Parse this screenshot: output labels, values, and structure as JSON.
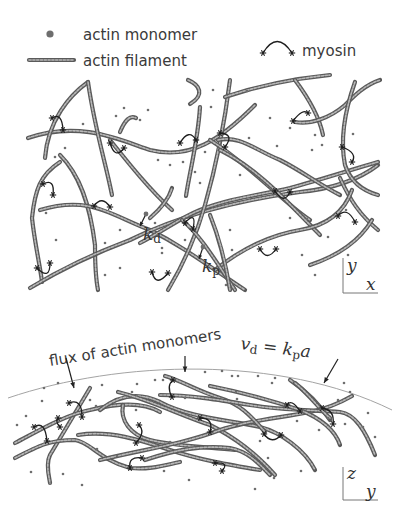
{
  "legend": {
    "monomer_label": "actin monomer",
    "filament_label": "actin filament",
    "myosin_label": "myosin"
  },
  "top_panel": {
    "rates": {
      "kd_main": "k",
      "kd_sub": "d",
      "kp_main": "k",
      "kp_sub": "p"
    },
    "axes": {
      "vertical": "y",
      "horizontal": "x"
    },
    "filaments": [
      "M28,138 C80,120 120,140 150,150 C190,160 220,140 255,105",
      "M45,158 C48,120 70,95 88,82",
      "M88,82 C95,130 105,160 112,195",
      "M188,80 C200,85 205,95 190,104",
      "M120,132 C125,120 130,115 136,118",
      "M200,107 C198,140 190,170 186,196",
      "M110,140 C130,165 150,190 172,210",
      "M60,155 C80,175 90,205 95,245 C95,270 97,285 98,290",
      "M60,162 C40,175 35,190 32,218 C35,245 40,265 42,282",
      "M40,210 C90,195 110,215 150,230 C180,245 200,260 245,290",
      "M30,288 C60,270 90,255 130,240 C180,215 240,200 300,192 C340,188 365,175 378,165",
      "M150,218 C165,205 170,195 172,188",
      "M140,243 C165,230 180,218 200,210 C230,198 260,195 290,188 C320,180 350,170 378,162",
      "M230,80 C225,120 215,170 205,205 C195,240 180,270 168,290",
      "M210,140 C250,165 280,200 310,220",
      "M218,140 C240,135 255,150 280,160 C300,170 320,185 340,195",
      "M220,150 C260,170 290,205 320,235",
      "M225,97 C260,85 300,78 330,75",
      "M295,80 C310,100 320,120 323,135",
      "M295,122 C310,125 330,118 345,105 C355,95 365,85 380,80",
      "M355,82 C345,110 340,140 345,165 C350,180 360,190 378,195",
      "M340,178 C350,200 360,215 378,230",
      "M215,270 C240,250 270,235 300,230 C330,225 345,210 352,190",
      "M310,265 C340,255 360,240 372,220",
      "M182,220 C200,235 215,260 235,290",
      "M210,215 C220,240 225,260 230,290"
    ],
    "myosins": [
      {
        "x1": 52,
        "y1": 118,
        "x2": 63,
        "y2": 130,
        "cx": 62,
        "cy": 112
      },
      {
        "x1": 110,
        "y1": 143,
        "x2": 124,
        "y2": 148,
        "cx": 115,
        "cy": 160
      },
      {
        "x1": 180,
        "y1": 143,
        "x2": 196,
        "y2": 140,
        "cx": 189,
        "cy": 128
      },
      {
        "x1": 220,
        "y1": 133,
        "x2": 225,
        "y2": 147,
        "cx": 235,
        "cy": 134
      },
      {
        "x1": 43,
        "y1": 184,
        "x2": 53,
        "y2": 195,
        "cx": 55,
        "cy": 178
      },
      {
        "x1": 94,
        "y1": 206,
        "x2": 110,
        "y2": 207,
        "cx": 102,
        "cy": 195
      },
      {
        "x1": 275,
        "y1": 191,
        "x2": 290,
        "y2": 192,
        "cx": 284,
        "cy": 205
      },
      {
        "x1": 185,
        "y1": 223,
        "x2": 193,
        "y2": 229,
        "cx": 197,
        "cy": 210
      },
      {
        "x1": 260,
        "y1": 249,
        "x2": 276,
        "y2": 249,
        "cx": 267,
        "cy": 262
      },
      {
        "x1": 293,
        "y1": 121,
        "x2": 308,
        "y2": 113,
        "cx": 303,
        "cy": 108
      },
      {
        "x1": 342,
        "y1": 147,
        "x2": 352,
        "y2": 162,
        "cx": 358,
        "cy": 153
      },
      {
        "x1": 338,
        "y1": 216,
        "x2": 355,
        "y2": 222,
        "cx": 347,
        "cy": 206
      },
      {
        "x1": 37,
        "y1": 268,
        "x2": 50,
        "y2": 263,
        "cx": 50,
        "cy": 281
      },
      {
        "x1": 152,
        "y1": 272,
        "x2": 168,
        "y2": 273,
        "cx": 156,
        "cy": 288
      }
    ],
    "monomers": [
      [
        124,
        108
      ],
      [
        148,
        110
      ],
      [
        116,
        116
      ],
      [
        140,
        120
      ],
      [
        83,
        124
      ],
      [
        65,
        148
      ],
      [
        55,
        157
      ],
      [
        158,
        160
      ],
      [
        205,
        152
      ],
      [
        211,
        107
      ],
      [
        213,
        90
      ],
      [
        247,
        91
      ],
      [
        270,
        118
      ],
      [
        249,
        138
      ],
      [
        290,
        128
      ],
      [
        277,
        146
      ],
      [
        315,
        135
      ],
      [
        322,
        145
      ],
      [
        312,
        150
      ],
      [
        240,
        175
      ],
      [
        170,
        165
      ],
      [
        195,
        172
      ],
      [
        46,
        213
      ],
      [
        56,
        240
      ],
      [
        105,
        243
      ],
      [
        120,
        230
      ],
      [
        155,
        223
      ],
      [
        162,
        248
      ],
      [
        105,
        275
      ],
      [
        120,
        268
      ],
      [
        162,
        253
      ],
      [
        230,
        230
      ],
      [
        232,
        250
      ],
      [
        290,
        218
      ],
      [
        307,
        219
      ],
      [
        328,
        237
      ],
      [
        353,
        134
      ],
      [
        346,
        210
      ],
      [
        302,
        255
      ],
      [
        348,
        255
      ],
      [
        315,
        275
      ],
      [
        200,
        183
      ],
      [
        183,
        162
      ],
      [
        226,
        285
      ],
      [
        185,
        240
      ]
    ],
    "kd_arrow": {
      "x1": 146,
      "y1": 214,
      "x2": 140,
      "y2": 226
    },
    "kp_arrow": {
      "x1": 203,
      "y1": 247,
      "x2": 199,
      "y2": 259
    },
    "kd_dot": [
      146,
      214
    ],
    "kp_dot": [
      203,
      247
    ]
  },
  "bottom_panel": {
    "annotation": {
      "prefix": "flux of actin monomers ",
      "vd_main": "v",
      "vd_sub": "d",
      "equals": " = ",
      "kp_main": "k",
      "kp_sub": "p",
      "a": "a"
    },
    "axes": {
      "vertical": "z",
      "horizontal": "y"
    },
    "cortex_path": "M8,398 C120,360 280,355 392,410",
    "arrows": [
      {
        "x1": 66,
        "y1": 358,
        "x2": 74,
        "y2": 388
      },
      {
        "x1": 185,
        "y1": 356,
        "x2": 185,
        "y2": 372
      },
      {
        "x1": 338,
        "y1": 359,
        "x2": 324,
        "y2": 383
      }
    ],
    "filaments": [
      "M90,388 C80,405 65,430 50,455 C45,465 50,480 50,483",
      "M15,443 C40,430 65,415 90,410 C110,405 140,400 160,412",
      "M15,458 C40,445 50,440 75,440 C90,442 100,460 130,468 C150,470 165,465 180,462",
      "M100,410 C115,398 135,390 160,402 C190,418 230,420 260,427 C280,432 305,450 315,470",
      "M118,392 C150,400 180,415 210,425 C240,440 260,458 275,475",
      "M78,435 C110,430 140,440 170,450 C200,460 230,465 260,470",
      "M123,405 C120,420 130,435 150,440 C180,447 210,447 235,450",
      "M100,460 C140,450 180,445 220,430 C250,420 280,418 310,412 C330,408 345,400 352,396",
      "M165,376 C180,380 195,390 220,398 C240,404 250,415 265,432",
      "M160,395 C190,395 220,400 250,405 C280,410 310,410 340,412 C355,414 365,430 375,455",
      "M210,386 C240,392 270,400 300,410 C320,418 335,430 340,445",
      "M290,380 C305,390 320,405 330,420",
      "M295,383 C310,395 320,410 330,418",
      "M145,460 C175,450 200,445 230,448 C250,452 260,465 270,475"
    ],
    "myosins": [
      {
        "x1": 69,
        "y1": 403,
        "x2": 82,
        "y2": 417,
        "cx": 82,
        "cy": 398
      },
      {
        "x1": 34,
        "y1": 427,
        "x2": 47,
        "y2": 441,
        "cx": 45,
        "cy": 420
      },
      {
        "x1": 173,
        "y1": 380,
        "x2": 172,
        "y2": 397,
        "cx": 166,
        "cy": 386
      },
      {
        "x1": 200,
        "y1": 418,
        "x2": 210,
        "y2": 432,
        "cx": 214,
        "cy": 418
      },
      {
        "x1": 139,
        "y1": 425,
        "x2": 136,
        "y2": 443,
        "cx": 146,
        "cy": 432
      },
      {
        "x1": 130,
        "y1": 468,
        "x2": 142,
        "y2": 458,
        "cx": 128,
        "cy": 456
      },
      {
        "x1": 287,
        "y1": 405,
        "x2": 300,
        "y2": 411,
        "cx": 291,
        "cy": 398
      },
      {
        "x1": 322,
        "y1": 408,
        "x2": 333,
        "y2": 424,
        "cx": 335,
        "cy": 410
      },
      {
        "x1": 264,
        "y1": 434,
        "x2": 281,
        "y2": 435,
        "cx": 272,
        "cy": 445
      },
      {
        "x1": 215,
        "y1": 463,
        "x2": 222,
        "y2": 471,
        "cx": 230,
        "cy": 462
      },
      {
        "x1": 58,
        "y1": 418,
        "x2": 60,
        "y2": 427,
        "cx": 55,
        "cy": 422
      }
    ],
    "monomers": [
      [
        44,
        388
      ],
      [
        58,
        383
      ],
      [
        42,
        401
      ],
      [
        26,
        416
      ],
      [
        17,
        425
      ],
      [
        102,
        385
      ],
      [
        137,
        384
      ],
      [
        132,
        392
      ],
      [
        155,
        380
      ],
      [
        163,
        380
      ],
      [
        205,
        372
      ],
      [
        222,
        371
      ],
      [
        232,
        376
      ],
      [
        238,
        376
      ],
      [
        258,
        376
      ],
      [
        272,
        383
      ],
      [
        275,
        378
      ],
      [
        236,
        392
      ],
      [
        185,
        398
      ],
      [
        136,
        410
      ],
      [
        96,
        406
      ],
      [
        90,
        400
      ],
      [
        31,
        472
      ],
      [
        63,
        474
      ],
      [
        82,
        485
      ],
      [
        97,
        449
      ],
      [
        117,
        456
      ],
      [
        237,
        399
      ],
      [
        237,
        425
      ],
      [
        260,
        441
      ],
      [
        268,
        458
      ],
      [
        297,
        421
      ],
      [
        328,
        418
      ],
      [
        338,
        400
      ],
      [
        344,
        383
      ],
      [
        350,
        392
      ],
      [
        368,
        413
      ],
      [
        375,
        437
      ],
      [
        164,
        471
      ],
      [
        189,
        480
      ],
      [
        255,
        489
      ],
      [
        274,
        478
      ],
      [
        301,
        471
      ],
      [
        363,
        427
      ],
      [
        319,
        430
      ],
      [
        345,
        424
      ],
      [
        187,
        447
      ],
      [
        170,
        442
      ]
    ]
  }
}
